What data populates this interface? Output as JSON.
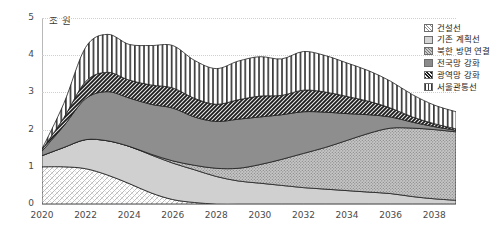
{
  "chart_data": {
    "type": "area",
    "title": "",
    "xlabel": "",
    "ylabel": "조 원",
    "unit_label": "조 원",
    "grid": true,
    "legend_position": "right",
    "xlim": [
      2020,
      2039
    ],
    "ylim": [
      0,
      5
    ],
    "y_ticks": [
      "0",
      "1",
      "2",
      "3",
      "4",
      "5"
    ],
    "y_tick_values": [
      0,
      1,
      2,
      3,
      4,
      5
    ],
    "x_ticks": [
      "2020",
      "2022",
      "2024",
      "2026",
      "2028",
      "2030",
      "2032",
      "2034",
      "2036",
      "2038"
    ],
    "x_tick_values": [
      2020,
      2022,
      2024,
      2026,
      2028,
      2030,
      2032,
      2034,
      2036,
      2038
    ],
    "x": [
      2020,
      2021,
      2022,
      2023,
      2024,
      2025,
      2026,
      2027,
      2028,
      2029,
      2030,
      2031,
      2032,
      2033,
      2034,
      2035,
      2036,
      2037,
      2038,
      2039
    ],
    "stacked": true,
    "stack_order_bottom_to_top": [
      "건설선",
      "기존 계획선",
      "북한 방면 연결",
      "전국망 강화",
      "광역망 강화",
      "서울관통선"
    ],
    "series": [
      {
        "name": "건설선",
        "pattern": "dotted-diagonal-mesh",
        "color": "#ffffff",
        "values": [
          1.0,
          1.0,
          0.95,
          0.78,
          0.55,
          0.3,
          0.12,
          0.04,
          0.0,
          0.0,
          0.0,
          0.0,
          0.0,
          0.0,
          0.0,
          0.0,
          0.0,
          0.0,
          0.0,
          0.0
        ]
      },
      {
        "name": "기존 계획선",
        "pattern": "solid",
        "color": "#d0d0d0",
        "values": [
          0.3,
          0.52,
          0.78,
          0.92,
          1.0,
          1.02,
          0.98,
          0.88,
          0.74,
          0.62,
          0.56,
          0.5,
          0.44,
          0.4,
          0.36,
          0.32,
          0.28,
          0.2,
          0.14,
          0.1
        ]
      },
      {
        "name": "북한 방면 연결",
        "pattern": "dotted-dense",
        "color": "#bdbdbd",
        "values": [
          0.0,
          0.0,
          0.0,
          0.0,
          0.0,
          0.02,
          0.06,
          0.12,
          0.22,
          0.34,
          0.5,
          0.7,
          0.92,
          1.12,
          1.35,
          1.58,
          1.76,
          1.84,
          1.86,
          1.84
        ]
      },
      {
        "name": "전국망 강화",
        "pattern": "solid",
        "color": "#8e8e8e",
        "values": [
          0.12,
          0.58,
          1.1,
          1.32,
          1.3,
          1.34,
          1.42,
          1.3,
          1.26,
          1.32,
          1.28,
          1.2,
          1.12,
          0.95,
          0.72,
          0.5,
          0.3,
          0.16,
          0.08,
          0.04
        ]
      },
      {
        "name": "광역망 강화",
        "pattern": "diagonal-hatch-dark",
        "color": "#2b2b2b",
        "values": [
          0.04,
          0.22,
          0.46,
          0.52,
          0.48,
          0.52,
          0.54,
          0.5,
          0.46,
          0.52,
          0.56,
          0.52,
          0.58,
          0.54,
          0.46,
          0.36,
          0.24,
          0.14,
          0.08,
          0.04
        ]
      },
      {
        "name": "서울관통선",
        "pattern": "vertical-lines",
        "color": "#ffffff",
        "values": [
          0.02,
          0.38,
          0.92,
          1.02,
          0.96,
          1.06,
          1.14,
          1.02,
          0.96,
          1.04,
          1.06,
          0.98,
          1.04,
          0.98,
          0.9,
          0.82,
          0.72,
          0.6,
          0.5,
          0.46
        ]
      }
    ]
  },
  "legend": {
    "items": [
      {
        "label": "건설선",
        "pattern": "dotted-diagonal-mesh"
      },
      {
        "label": "기존 계획선",
        "pattern": "solid-light"
      },
      {
        "label": "북한 방면 연결",
        "pattern": "dotted-dense"
      },
      {
        "label": "전국망 강화",
        "pattern": "solid-mid"
      },
      {
        "label": "광역망 강화",
        "pattern": "diagonal-hatch-dark"
      },
      {
        "label": "서울관통선",
        "pattern": "vertical-lines"
      }
    ]
  }
}
